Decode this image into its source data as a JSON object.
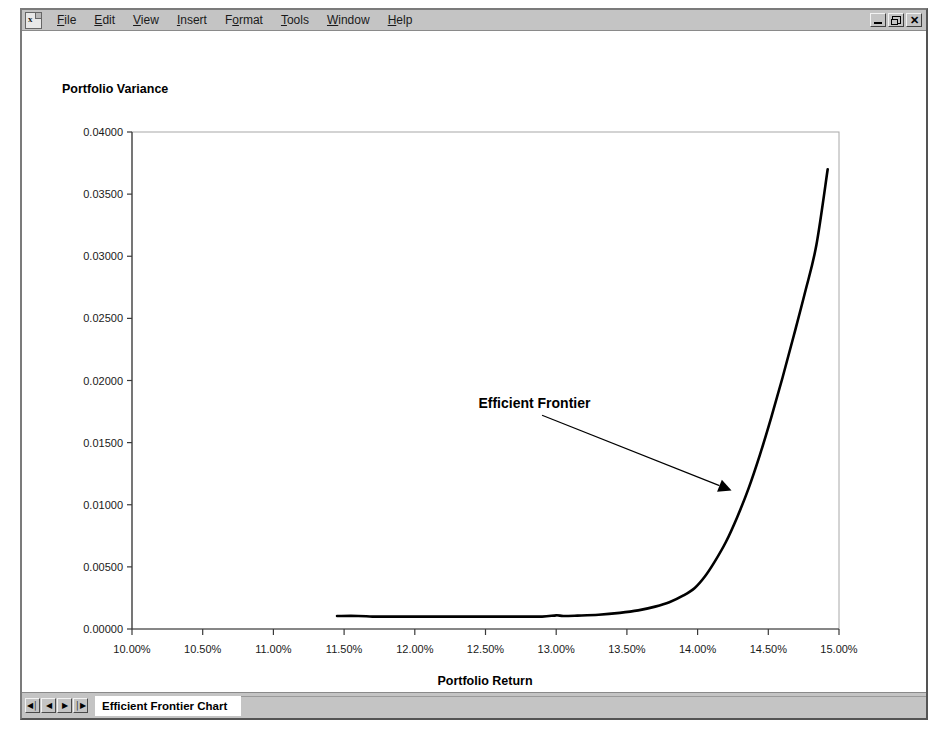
{
  "window": {
    "app_icon": "spreadsheet-document-icon",
    "menu": [
      {
        "label": "File",
        "accel": "F"
      },
      {
        "label": "Edit",
        "accel": "E"
      },
      {
        "label": "View",
        "accel": "V"
      },
      {
        "label": "Insert",
        "accel": "I"
      },
      {
        "label": "Format",
        "accel": "o"
      },
      {
        "label": "Tools",
        "accel": "T"
      },
      {
        "label": "Window",
        "accel": "W"
      },
      {
        "label": "Help",
        "accel": "H"
      }
    ],
    "controls": [
      {
        "name": "minimize-button",
        "glyph": "_"
      },
      {
        "name": "restore-button",
        "glyph": "❐"
      },
      {
        "name": "close-button",
        "glyph": "✕"
      }
    ]
  },
  "tabbar": {
    "nav_first": "◀│",
    "nav_prev": "◀",
    "nav_next": "▶",
    "nav_last": "│▶",
    "active_sheet": "Efficient Frontier Chart"
  },
  "chart_data": {
    "type": "line",
    "title": "",
    "xlabel": "Portfolio Return",
    "ylabel": "Portfolio Variance",
    "xlim": [
      0.1,
      0.15
    ],
    "ylim": [
      0.0,
      0.04
    ],
    "grid": false,
    "legend": "none",
    "xticklabels": [
      "10.00%",
      "10.50%",
      "11.00%",
      "11.50%",
      "12.00%",
      "12.50%",
      "13.00%",
      "13.50%",
      "14.00%",
      "14.50%",
      "15.00%"
    ],
    "xtickvalues": [
      0.1,
      0.105,
      0.11,
      0.115,
      0.12,
      0.125,
      0.13,
      0.135,
      0.14,
      0.145,
      0.15
    ],
    "yticklabels": [
      "0.00000",
      "0.00500",
      "0.01000",
      "0.01500",
      "0.02000",
      "0.02500",
      "0.03000",
      "0.03500",
      "0.04000"
    ],
    "ytickvalues": [
      0.0,
      0.005,
      0.01,
      0.015,
      0.02,
      0.025,
      0.03,
      0.035,
      0.04
    ],
    "annotations": [
      {
        "text": "Efficient Frontier",
        "text_x": 0.1245,
        "text_y": 0.0178,
        "arrow_from_x": 0.129,
        "arrow_from_y": 0.0172,
        "arrow_to_x": 0.1424,
        "arrow_to_y": 0.01115
      }
    ],
    "series": [
      {
        "name": "Efficient Frontier",
        "color": "#000000",
        "x": [
          0.1145,
          0.116,
          0.117,
          0.118,
          0.1195,
          0.121,
          0.123,
          0.125,
          0.127,
          0.129,
          0.13,
          0.1305,
          0.1315,
          0.133,
          0.1345,
          0.1358,
          0.137,
          0.138,
          0.139,
          0.1398,
          0.1405,
          0.1412,
          0.142,
          0.1428,
          0.1436,
          0.1444,
          0.1452,
          0.146,
          0.1468,
          0.1476,
          0.1484,
          0.1492
        ],
        "y": [
          0.00105,
          0.00105,
          0.001,
          0.001,
          0.001,
          0.001,
          0.001,
          0.001,
          0.001,
          0.001,
          0.0011,
          0.00105,
          0.00108,
          0.00115,
          0.0013,
          0.0015,
          0.0018,
          0.00215,
          0.0027,
          0.0033,
          0.0042,
          0.0054,
          0.007,
          0.009,
          0.0113,
          0.014,
          0.017,
          0.0202,
          0.0236,
          0.0271,
          0.0309,
          0.037
        ]
      }
    ]
  }
}
